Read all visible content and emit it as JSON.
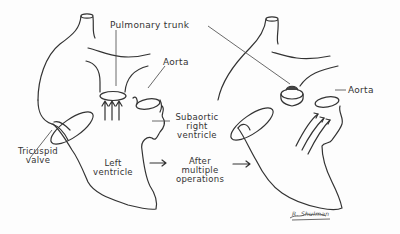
{
  "labels": {
    "pulmonary_trunk": "Pulmonary trunk",
    "aorta_left": "Aorta",
    "aorta_right": "Aorta",
    "subaortic_line1": "Subaortic",
    "subaortic_line2": "right",
    "subaortic_line3": "ventricle",
    "tricuspid_line1": "Tricuspid",
    "tricuspid_line2": "valve",
    "left_ventricle_line1": "Left",
    "left_ventricle_line2": "ventricle",
    "after_line1": "After",
    "after_line2": "multiple",
    "after_line3": "operations",
    "signature": "R. Shulman"
  },
  "colors": {
    "ink": "#333333",
    "background": "#fdfdfd"
  }
}
